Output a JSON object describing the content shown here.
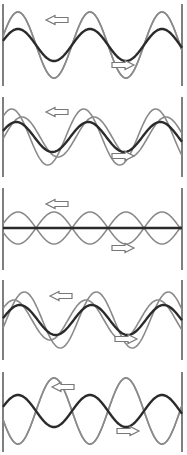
{
  "diagram": {
    "title": "",
    "colors": {
      "background": "#ffffff",
      "wall": "#555555",
      "component_wave": "#8a8a8a",
      "resultant_wave": "#2a2a2a",
      "arrow_fill": "#ffffff",
      "arrow_stroke": "#777777"
    },
    "layout": {
      "left_wall_x": 3,
      "right_wall_x": 182,
      "wavelength_px": 72
    },
    "panels": [
      {
        "id": "panel-1",
        "top": 4,
        "height": 82,
        "center_y": 45,
        "left_arrow": {
          "x": 46,
          "y": 20,
          "direction": "left"
        },
        "right_arrow": {
          "x": 112,
          "y": 65,
          "direction": "right"
        },
        "waves": [
          {
            "role": "component",
            "amp": 33,
            "phase": 0.0
          },
          {
            "role": "component",
            "amp": 33,
            "phase": 0.0
          },
          {
            "role": "resultant",
            "amp": 16,
            "phase": 0.0
          }
        ]
      },
      {
        "id": "panel-2",
        "top": 97,
        "height": 80,
        "center_y": 137,
        "left_arrow": {
          "x": 46,
          "y": 112,
          "direction": "left"
        },
        "right_arrow": {
          "x": 112,
          "y": 156,
          "direction": "right"
        },
        "waves": [
          {
            "role": "component",
            "amp": 28,
            "phase": 0.55
          },
          {
            "role": "component",
            "amp": 20,
            "phase": -0.35
          },
          {
            "role": "resultant",
            "amp": 15,
            "phase": 0.15
          }
        ]
      },
      {
        "id": "panel-3",
        "top": 188,
        "height": 82,
        "center_y": 228,
        "left_arrow": {
          "x": 46,
          "y": 204,
          "direction": "left"
        },
        "right_arrow": {
          "x": 112,
          "y": 248,
          "direction": "right"
        },
        "waves": [
          {
            "role": "component",
            "amp": 16,
            "phase": 3.14159
          },
          {
            "role": "component",
            "amp": 16,
            "phase": 0.0
          },
          {
            "role": "resultant",
            "amp": 0,
            "phase": 0.0
          }
        ]
      },
      {
        "id": "panel-4",
        "top": 280,
        "height": 80,
        "center_y": 320,
        "left_arrow": {
          "x": 50,
          "y": 296,
          "direction": "left"
        },
        "right_arrow": {
          "x": 115,
          "y": 339,
          "direction": "right"
        },
        "waves": [
          {
            "role": "component",
            "amp": 28,
            "phase": -0.55
          },
          {
            "role": "component",
            "amp": 20,
            "phase": 0.35
          },
          {
            "role": "resultant",
            "amp": 15,
            "phase": -0.15
          }
        ]
      },
      {
        "id": "panel-5",
        "top": 372,
        "height": 80,
        "center_y": 411,
        "left_arrow": {
          "x": 52,
          "y": 387,
          "direction": "left"
        },
        "right_arrow": {
          "x": 117,
          "y": 431,
          "direction": "right"
        },
        "waves": [
          {
            "role": "component",
            "amp": 33,
            "phase": 3.14159
          },
          {
            "role": "component",
            "amp": 33,
            "phase": 3.14159
          },
          {
            "role": "resultant",
            "amp": 16,
            "phase": 0.0
          }
        ]
      }
    ]
  }
}
